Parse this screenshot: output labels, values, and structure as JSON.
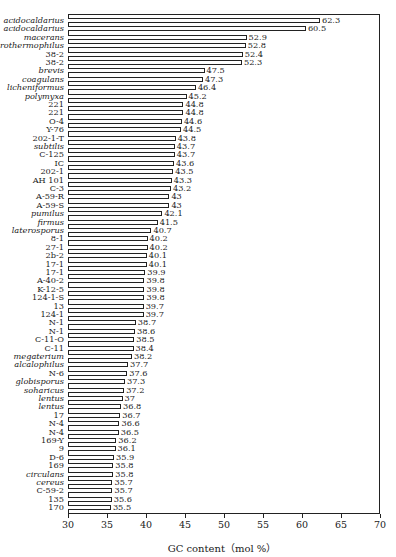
{
  "chart_data": {
    "type": "bar",
    "orientation": "horizontal",
    "title": "",
    "xlabel": "GC content（mol %）",
    "ylabel": "",
    "xlim": [
      30,
      70
    ],
    "x_ticks": [
      30,
      35,
      40,
      45,
      50,
      55,
      60,
      65,
      70
    ],
    "grid": false,
    "legend": null,
    "categories": [
      {
        "label": "acidocaldarius",
        "italic": true,
        "value": 62.3
      },
      {
        "label": "acidocaldarius",
        "italic": true,
        "value": 60.5
      },
      {
        "label": "macerans",
        "italic": true,
        "value": 52.9
      },
      {
        "label": "stearothermophilus",
        "italic": true,
        "value": 52.8
      },
      {
        "label": "38-2",
        "italic": false,
        "value": 52.4
      },
      {
        "label": "38-2",
        "italic": false,
        "value": 52.3
      },
      {
        "label": "brevis",
        "italic": true,
        "value": 47.5
      },
      {
        "label": "coagulans",
        "italic": true,
        "value": 47.3
      },
      {
        "label": "licheniformus",
        "italic": true,
        "value": 46.4
      },
      {
        "label": "polymyxa",
        "italic": true,
        "value": 45.2
      },
      {
        "label": "221",
        "italic": false,
        "value": 44.8
      },
      {
        "label": "221",
        "italic": false,
        "value": 44.8
      },
      {
        "label": "O-4",
        "italic": false,
        "value": 44.6
      },
      {
        "label": "Y-76",
        "italic": false,
        "value": 44.5
      },
      {
        "label": "202-1-T",
        "italic": false,
        "value": 43.8
      },
      {
        "label": "subtilis",
        "italic": true,
        "value": 43.7
      },
      {
        "label": "C-125",
        "italic": false,
        "value": 43.7
      },
      {
        "label": "IC",
        "italic": false,
        "value": 43.6
      },
      {
        "label": "202-1",
        "italic": false,
        "value": 43.5
      },
      {
        "label": "AH 101",
        "italic": false,
        "value": 43.3
      },
      {
        "label": "C-3",
        "italic": false,
        "value": 43.2
      },
      {
        "label": "A-59-R",
        "italic": false,
        "value": 43
      },
      {
        "label": "A-59-S",
        "italic": false,
        "value": 43
      },
      {
        "label": "pumilus",
        "italic": true,
        "value": 42.1
      },
      {
        "label": "firmus",
        "italic": true,
        "value": 41.5
      },
      {
        "label": "laterosporus",
        "italic": true,
        "value": 40.7
      },
      {
        "label": "8-1",
        "italic": false,
        "value": 40.2
      },
      {
        "label": "27-1",
        "italic": false,
        "value": 40.2
      },
      {
        "label": "2b-2",
        "italic": false,
        "value": 40.1
      },
      {
        "label": "17-1",
        "italic": false,
        "value": 40.1
      },
      {
        "label": "17-1",
        "italic": false,
        "value": 39.9
      },
      {
        "label": "A-40-2",
        "italic": false,
        "value": 39.8
      },
      {
        "label": "K-12-5",
        "italic": false,
        "value": 39.8
      },
      {
        "label": "124-1-S",
        "italic": false,
        "value": 39.8
      },
      {
        "label": "13",
        "italic": false,
        "value": 39.7
      },
      {
        "label": "124-1",
        "italic": false,
        "value": 39.7
      },
      {
        "label": "N-1",
        "italic": false,
        "value": 38.7
      },
      {
        "label": "N-1",
        "italic": false,
        "value": 38.6
      },
      {
        "label": "C-11-O",
        "italic": false,
        "value": 38.5
      },
      {
        "label": "C-11",
        "italic": false,
        "value": 38.4
      },
      {
        "label": "megaterium",
        "italic": true,
        "value": 38.2
      },
      {
        "label": "alcalophilus",
        "italic": true,
        "value": 37.7
      },
      {
        "label": "N-6",
        "italic": false,
        "value": 37.6
      },
      {
        "label": "globisporus",
        "italic": true,
        "value": 37.3
      },
      {
        "label": "soharicus",
        "italic": true,
        "value": 37.2
      },
      {
        "label": "lentus",
        "italic": true,
        "value": 37
      },
      {
        "label": "lentus",
        "italic": true,
        "value": 36.8
      },
      {
        "label": "17",
        "italic": false,
        "value": 36.7
      },
      {
        "label": "N-4",
        "italic": false,
        "value": 36.6
      },
      {
        "label": "N-4",
        "italic": false,
        "value": 36.5
      },
      {
        "label": "169-Y",
        "italic": false,
        "value": 36.2
      },
      {
        "label": "9",
        "italic": false,
        "value": 36.1
      },
      {
        "label": "D-6",
        "italic": false,
        "value": 35.9
      },
      {
        "label": "169",
        "italic": false,
        "value": 35.8
      },
      {
        "label": "circulans",
        "italic": true,
        "value": 35.8
      },
      {
        "label": "cereus",
        "italic": true,
        "value": 35.7
      },
      {
        "label": "C-59-2",
        "italic": false,
        "value": 35.7
      },
      {
        "label": "135",
        "italic": false,
        "value": 35.6
      },
      {
        "label": "170",
        "italic": false,
        "value": 35.5
      }
    ]
  }
}
